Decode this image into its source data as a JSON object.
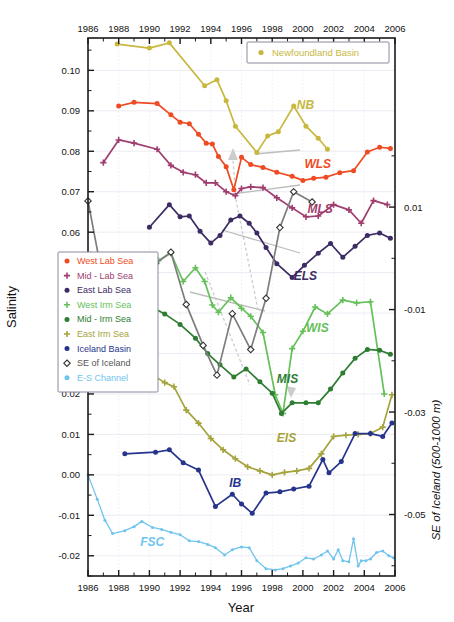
{
  "chart_data": {
    "type": "line",
    "title": "",
    "xlabel": "Year",
    "ylabel": "Salinity",
    "ylabel_right": "SE of Iceland (500-1000 m)",
    "xlim": [
      1986,
      2006
    ],
    "ylim": [
      -0.025,
      0.108
    ],
    "ylim_right": [
      -0.062,
      0.043
    ],
    "grid": true,
    "xticks": [
      1986,
      1988,
      1990,
      1992,
      1994,
      1996,
      1998,
      2000,
      2002,
      2004,
      2006
    ],
    "xticklabels": [
      "1986",
      "1988",
      "1990",
      "1992",
      "1994",
      "1996",
      "1998",
      "2000",
      "2002",
      "2004",
      "2006"
    ],
    "yticks": [
      -0.02,
      -0.01,
      0.0,
      0.01,
      0.02,
      0.03,
      0.04,
      0.05,
      0.06,
      0.07,
      0.08,
      0.09,
      0.1
    ],
    "yticklabels": [
      "-0.02",
      "-0.01",
      "0.00",
      "0.01",
      "0.02",
      "0.03",
      "0.04",
      "0.05",
      "0.06",
      "0.07",
      "0.08",
      "0.09",
      "0.10"
    ],
    "yticks_right": [
      0.01,
      -0.01,
      -0.03,
      -0.05
    ],
    "yticklabels_right": [
      "0.01",
      "-0.01",
      "-0.03",
      "-0.05"
    ],
    "top_axis": true,
    "legend_position": "left-middle",
    "series": [
      {
        "name": "Newfoundland Basin",
        "tag": "NB",
        "color": "#c8b83f",
        "marker": "circle",
        "axis": "left",
        "tag_x": 1999.6,
        "tag_y": 0.0905,
        "x": [
          1987.9,
          1990.0,
          1991.3,
          1993.6,
          1994.4,
          1995.0,
          1995.6,
          1997.0,
          1997.7,
          1998.4,
          1999.4,
          2000.2,
          2001.0,
          2001.6
        ],
        "y": [
          0.1065,
          0.1055,
          0.1068,
          0.0962,
          0.0977,
          0.0925,
          0.0862,
          0.0797,
          0.0838,
          0.0848,
          0.0912,
          0.0862,
          0.0832,
          0.0805
        ]
      },
      {
        "name": "West Lab Sea",
        "tag": "WLS",
        "color": "#ef4b23",
        "marker": "circle",
        "axis": "left",
        "tag_x": 2000.1,
        "tag_y": 0.0758,
        "x": [
          1988.0,
          1989.0,
          1990.5,
          1991.4,
          1992.0,
          1992.6,
          1993.2,
          1993.7,
          1994.1,
          1994.5,
          1995.0,
          1995.5,
          1996.0,
          1996.6,
          1997.4,
          1998.3,
          1999.3,
          2000.0,
          2000.7,
          2001.5,
          2002.4,
          2003.3,
          2004.2,
          2005.0,
          2005.7
        ],
        "y": [
          0.0912,
          0.0921,
          0.0918,
          0.089,
          0.0872,
          0.0868,
          0.0842,
          0.082,
          0.0818,
          0.0787,
          0.0762,
          0.0705,
          0.0785,
          0.0767,
          0.076,
          0.0748,
          0.0738,
          0.0728,
          0.0733,
          0.0736,
          0.0747,
          0.0752,
          0.0798,
          0.081,
          0.0807
        ]
      },
      {
        "name": "Mid - Lab Sea",
        "tag": "MLS",
        "color": "#a03d6f",
        "marker": "plus",
        "axis": "left",
        "tag_x": 2000.3,
        "tag_y": 0.0648,
        "x": [
          1987.0,
          1988.0,
          1989.0,
          1990.5,
          1991.4,
          1992.2,
          1993.0,
          1993.7,
          1994.3,
          1995.0,
          1995.6,
          1996.0,
          1996.6,
          1997.4,
          1998.3,
          1999.3,
          2000.2,
          2001.0,
          2002.0,
          2003.0,
          2003.8,
          2004.6,
          2005.5
        ],
        "y": [
          0.0772,
          0.0828,
          0.082,
          0.0805,
          0.0765,
          0.0748,
          0.0742,
          0.0722,
          0.0722,
          0.07,
          0.069,
          0.0708,
          0.0712,
          0.071,
          0.0685,
          0.066,
          0.0638,
          0.064,
          0.0668,
          0.0655,
          0.0622,
          0.0678,
          0.0668
        ]
      },
      {
        "name": "East Lab Sea",
        "tag": "ELS",
        "color": "#3d2b63",
        "marker": "circle",
        "axis": "left",
        "tag_x": 1999.4,
        "tag_y": 0.0482,
        "x": [
          1990.0,
          1991.3,
          1992.0,
          1992.6,
          1993.3,
          1994.0,
          1994.6,
          1995.3,
          1995.9,
          1996.5,
          1997.0,
          1997.6,
          1998.3,
          1999.3,
          2000.1,
          2001.0,
          2001.8,
          2002.6,
          2003.4,
          2004.2,
          2005.0,
          2005.7
        ],
        "y": [
          0.0612,
          0.0668,
          0.0638,
          0.064,
          0.0602,
          0.0573,
          0.0592,
          0.063,
          0.064,
          0.0622,
          0.0598,
          0.0562,
          0.0522,
          0.0488,
          0.0518,
          0.0548,
          0.0572,
          0.0538,
          0.0565,
          0.0592,
          0.0598,
          0.0585
        ]
      },
      {
        "name": "West Irm Sea",
        "tag": "WIS",
        "color": "#66c05a",
        "marker": "plus",
        "axis": "left",
        "tag_x": 2000.2,
        "tag_y": 0.0352,
        "x": [
          1990.0,
          1990.6,
          1991.4,
          1992.2,
          1993.0,
          1993.6,
          1994.1,
          1994.5,
          1995.3,
          1996.0,
          1996.6,
          1997.4,
          1998.2,
          1998.7,
          1999.3,
          2000.0,
          2000.8,
          2001.6,
          2002.6,
          2003.5,
          2004.4,
          2005.3
        ],
        "y": [
          0.0542,
          0.053,
          0.0548,
          0.0478,
          0.0512,
          0.0478,
          0.042,
          0.0402,
          0.0438,
          0.0412,
          0.0392,
          0.0352,
          0.0198,
          0.0152,
          0.0312,
          0.0355,
          0.0415,
          0.0398,
          0.0432,
          0.0425,
          0.0428,
          0.02
        ]
      },
      {
        "name": "Mid - Irm Sea",
        "tag": "MIS",
        "color": "#2f7d32",
        "marker": "circle",
        "axis": "left",
        "tag_x": 1998.3,
        "tag_y": 0.0228,
        "x": [
          1990.0,
          1991.0,
          1992.0,
          1993.0,
          1993.8,
          1994.6,
          1995.5,
          1996.3,
          1997.2,
          1998.0,
          1998.6,
          1999.3,
          2000.2,
          2001.0,
          2001.8,
          2002.6,
          2003.4,
          2004.2,
          2005.0,
          2005.7
        ],
        "y": [
          0.0418,
          0.0398,
          0.0372,
          0.0338,
          0.03,
          0.0272,
          0.0242,
          0.0262,
          0.023,
          0.0202,
          0.0152,
          0.0178,
          0.0178,
          0.0178,
          0.0212,
          0.0252,
          0.0288,
          0.031,
          0.0308,
          0.0298
        ]
      },
      {
        "name": "East Irm Sea",
        "tag": "EIS",
        "color": "#a5a33c",
        "marker": "plus",
        "axis": "left",
        "tag_x": 1998.3,
        "tag_y": 0.0082,
        "x": [
          1987.2,
          1988.0,
          1989.0,
          1990.0,
          1991.0,
          1991.6,
          1992.4,
          1993.2,
          1994.0,
          1994.8,
          1995.6,
          1996.4,
          1997.2,
          1998.0,
          1998.8,
          1999.6,
          2000.4,
          2001.2,
          2002.0,
          2002.8,
          2003.6,
          2004.4,
          2005.2,
          2005.8
        ],
        "y": [
          0.0272,
          0.0288,
          0.0268,
          0.0252,
          0.0228,
          0.0218,
          0.016,
          0.0128,
          0.009,
          0.0062,
          0.004,
          0.002,
          0.001,
          0.0,
          0.0006,
          0.001,
          0.0016,
          0.0052,
          0.0095,
          0.0098,
          0.01,
          0.0102,
          0.0118,
          0.0198
        ]
      },
      {
        "name": "Iceland Basin",
        "tag": "IB",
        "color": "#27348b",
        "marker": "circle",
        "axis": "left",
        "tag_x": 1995.2,
        "tag_y": -0.003,
        "x": [
          1988.4,
          1990.4,
          1991.3,
          1992.2,
          1993.2,
          1994.3,
          1995.4,
          1996.0,
          1996.7,
          1997.6,
          1998.5,
          1999.4,
          2000.4,
          2001.3,
          2001.7,
          2002.5,
          2003.4,
          2004.4,
          2005.2,
          2005.8
        ],
        "y": [
          0.0052,
          0.0056,
          0.0062,
          0.003,
          0.0012,
          -0.0078,
          -0.0048,
          -0.0072,
          -0.0095,
          -0.0045,
          -0.0042,
          -0.0035,
          -0.0028,
          0.0038,
          0.0005,
          0.0033,
          0.0102,
          0.0102,
          0.0095,
          0.0128
        ]
      },
      {
        "name": "SE of Iceland",
        "tag": "SEI",
        "color": "#7d7d7d",
        "marker": "diamond",
        "axis": "right",
        "tag_x": 1989.0,
        "tag_y": -0.0052,
        "x": [
          1986.0,
          1986.9,
          1987.5,
          1988.3,
          1989.4,
          1990.4,
          1991.4,
          1992.4,
          1993.5,
          1994.4,
          1995.4,
          1996.6,
          1997.6,
          1998.5,
          1999.4,
          2000.6
        ],
        "y": [
          0.0112,
          -0.003,
          -0.007,
          -0.0102,
          -0.0065,
          -0.001,
          0.0012,
          -0.009,
          -0.017,
          -0.0228,
          -0.0108,
          -0.0178,
          -0.0078,
          0.006,
          0.013,
          0.011
        ]
      },
      {
        "name": "F-S Channel",
        "tag": "FSC",
        "color": "#6fc3ef",
        "marker": "circle-small",
        "axis": "left",
        "tag_x": 1989.4,
        "tag_y": -0.0175,
        "x": [
          1986.0,
          1986.6,
          1987.1,
          1987.6,
          1988.4,
          1989.0,
          1989.5,
          1990.2,
          1990.8,
          1991.4,
          1992.0,
          1992.6,
          1993.2,
          1993.8,
          1994.3,
          1994.9,
          1995.4,
          1996.0,
          1996.5,
          1997.0,
          1997.6,
          1998.2,
          1998.7,
          1999.2,
          1999.7,
          2000.2,
          2000.7,
          2001.2,
          2001.6,
          2002.0,
          2002.3,
          2002.6,
          2003.0,
          2003.3,
          2003.6,
          2003.8,
          2004.1,
          2004.4,
          2004.8,
          2005.2,
          2005.6,
          2005.9
        ],
        "y": [
          0.0,
          -0.006,
          -0.0112,
          -0.0145,
          -0.0138,
          -0.0128,
          -0.0115,
          -0.013,
          -0.0135,
          -0.0142,
          -0.0148,
          -0.0163,
          -0.0165,
          -0.0172,
          -0.018,
          -0.0198,
          -0.0185,
          -0.0178,
          -0.018,
          -0.0212,
          -0.0232,
          -0.0235,
          -0.0232,
          -0.0225,
          -0.0218,
          -0.0205,
          -0.0208,
          -0.0198,
          -0.0188,
          -0.0208,
          -0.0185,
          -0.0212,
          -0.0215,
          -0.0158,
          -0.0225,
          -0.0212,
          -0.0212,
          -0.0208,
          -0.0192,
          -0.0188,
          -0.02,
          -0.0205
        ]
      }
    ],
    "annotations": [
      {
        "label": "propagation-arrow-upward",
        "type": "arrow"
      },
      {
        "label": "nb-wls-connector",
        "type": "line"
      },
      {
        "label": "wls-mls-connector",
        "type": "line"
      },
      {
        "label": "mls-els-connector",
        "type": "line"
      },
      {
        "label": "els-wis-connector",
        "type": "line"
      }
    ]
  },
  "legend": {
    "items": [
      {
        "label": "West Lab Sea",
        "color": "#ef4b23",
        "marker": "circle"
      },
      {
        "label": "Mid - Lab Sea",
        "color": "#a03d6f",
        "marker": "plus"
      },
      {
        "label": "East Lab Sea",
        "color": "#3d2b63",
        "marker": "circle"
      },
      {
        "label": "West Irm Sea",
        "color": "#66c05a",
        "marker": "plus"
      },
      {
        "label": "Mid - Irm Sea",
        "color": "#2f7d32",
        "marker": "circle"
      },
      {
        "label": "East Irm Sea",
        "color": "#a5a33c",
        "marker": "plus"
      },
      {
        "label": "Iceland Basin",
        "color": "#27348b",
        "marker": "circle"
      },
      {
        "label": "SE of Iceland",
        "color": "#555555",
        "marker": "diamond"
      },
      {
        "label": "E-S Channel",
        "color": "#6fc3ef",
        "marker": "circle"
      }
    ]
  },
  "nb_legend": {
    "label": "Newfoundland Basin",
    "color": "#c8b83f",
    "marker": "circle"
  }
}
